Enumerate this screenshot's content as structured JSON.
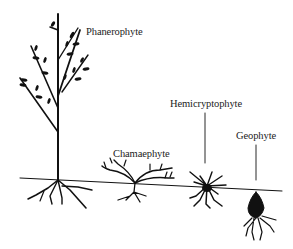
{
  "diagram": {
    "type": "raunkiaer-life-forms",
    "ground_line": true,
    "ink_color": "#111111",
    "background": "#ffffff",
    "labels": [
      {
        "id": "phanerophyte",
        "text": "Phanerophyte"
      },
      {
        "id": "chamaephyte",
        "text": "Chamaephyte"
      },
      {
        "id": "hemicryptophyte",
        "text": "Hemicryptophyte"
      },
      {
        "id": "geophyte",
        "text": "Geophyte"
      }
    ]
  }
}
